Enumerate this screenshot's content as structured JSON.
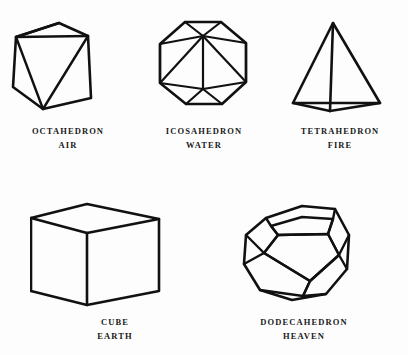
{
  "figure": {
    "background_color": "#fdfdfd",
    "stroke_color": "#111111",
    "solids": [
      {
        "id": "octahedron",
        "name": "OCTAHEDRON",
        "element": "AIR",
        "shape_type": "octahedron",
        "faces": 8,
        "vertices": 6,
        "edges": 12
      },
      {
        "id": "icosahedron",
        "name": "ICOSAHEDRON",
        "element": "WATER",
        "shape_type": "icosahedron",
        "faces": 20,
        "vertices": 12,
        "edges": 30
      },
      {
        "id": "tetrahedron",
        "name": "TETRAHEDRON",
        "element": "FIRE",
        "shape_type": "tetrahedron",
        "faces": 4,
        "vertices": 4,
        "edges": 6
      },
      {
        "id": "cube",
        "name": "CUBE",
        "element": "EARTH",
        "shape_type": "hexahedron",
        "faces": 6,
        "vertices": 8,
        "edges": 12
      },
      {
        "id": "dodecahedron",
        "name": "DODECAHEDRON",
        "element": "HEAVEN",
        "shape_type": "dodecahedron",
        "faces": 12,
        "vertices": 20,
        "edges": 30
      }
    ]
  }
}
